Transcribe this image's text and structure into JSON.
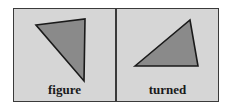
{
  "diagram": {
    "panels": [
      {
        "label": "figure",
        "triangle": {
          "points": "36,25 85,19 84,81"
        }
      },
      {
        "label": "turned",
        "triangle": {
          "points": "135,66 190,20 198,66"
        }
      }
    ],
    "colors": {
      "panel_background": "#d6d6d6",
      "border": "#3a3a3a",
      "triangle_fill": "#8a8a8a",
      "triangle_stroke": "#1a1a1a",
      "label_text": "#1a1a1a"
    }
  }
}
